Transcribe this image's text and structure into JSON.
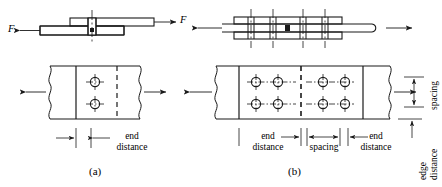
{
  "figure": {
    "width": 442,
    "height": 187,
    "line_color": "#1a1a1a",
    "background": "#ffffff"
  },
  "panel_a": {
    "caption": "(a)",
    "type": "lap-splice-joint",
    "force_left_label": "F",
    "force_right_label": "F",
    "bolt_count": 2,
    "bolt_rows": 2,
    "bolt_columns": 1,
    "dimensions": [
      {
        "name": "edge-arrow",
        "label": ""
      },
      {
        "name": "end-distance",
        "label_line1": "end",
        "label_line2": "distance"
      }
    ]
  },
  "panel_b": {
    "caption": "(b)",
    "type": "butt-joint-with-splice-plates",
    "bolt_count": 8,
    "bolt_rows": 2,
    "bolt_columns": 4,
    "dimensions": [
      {
        "name": "end-distance-left",
        "label_line1": "end",
        "label_line2": "distance"
      },
      {
        "name": "spacing-horizontal",
        "label_line1": "spacing",
        "label_line2": ""
      },
      {
        "name": "end-distance-right",
        "label_line1": "end",
        "label_line2": "distance"
      },
      {
        "name": "spacing-vertical",
        "label_line1": "spacing",
        "label_line2": ""
      },
      {
        "name": "edge-distance",
        "label_line1": "edge",
        "label_line2": "distance"
      }
    ]
  },
  "labels": {
    "end": "end",
    "distance": "distance",
    "spacing": "spacing",
    "edge": "edge",
    "force": "F",
    "caption_a": "(a)",
    "caption_b": "(b)"
  }
}
